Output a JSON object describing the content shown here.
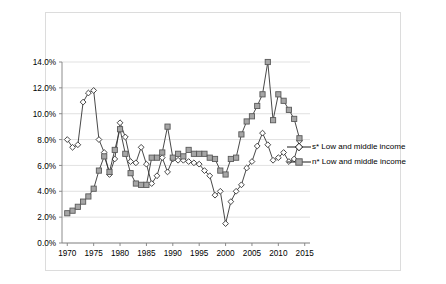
{
  "chart_data": {
    "type": "line",
    "title": "s* and n* low and middle income countries, 1970-2014",
    "xlabel": "",
    "ylabel": "",
    "xlim": [
      1969,
      2016
    ],
    "ylim": [
      0,
      14
    ],
    "ytick_labels": [
      "0.0%",
      "2.0%",
      "4.0%",
      "6.0%",
      "8.0%",
      "10.0%",
      "12.0%",
      "14.0%"
    ],
    "ytick_values": [
      0,
      2,
      4,
      6,
      8,
      10,
      12,
      14
    ],
    "xtick_labels": [
      "1970",
      "1975",
      "1980",
      "1985",
      "1990",
      "1995",
      "2000",
      "2005",
      "2010",
      "2015"
    ],
    "xtick_values": [
      1970,
      1975,
      1980,
      1985,
      1990,
      1995,
      2000,
      2005,
      2010,
      2015
    ],
    "grid": true,
    "legend_position": "right",
    "x": [
      1970,
      1971,
      1972,
      1973,
      1974,
      1975,
      1976,
      1977,
      1978,
      1979,
      1980,
      1981,
      1982,
      1983,
      1984,
      1985,
      1986,
      1987,
      1988,
      1989,
      1990,
      1991,
      1992,
      1993,
      1994,
      1995,
      1996,
      1997,
      1998,
      1999,
      2000,
      2001,
      2002,
      2003,
      2004,
      2005,
      2006,
      2007,
      2008,
      2009,
      2010,
      2011,
      2012,
      2013,
      2014
    ],
    "series": [
      {
        "name": "s* Low and middle income",
        "marker": "diamond-hollow",
        "color": "#000000",
        "values": [
          8.0,
          7.4,
          7.6,
          10.9,
          11.6,
          11.8,
          8.0,
          7.0,
          5.3,
          6.5,
          9.3,
          8.2,
          6.3,
          6.2,
          7.4,
          6.1,
          4.6,
          5.2,
          6.6,
          5.5,
          6.5,
          6.4,
          6.4,
          6.3,
          6.2,
          6.1,
          5.6,
          5.2,
          3.7,
          4.0,
          1.5,
          3.2,
          4.0,
          4.5,
          5.8,
          6.3,
          7.5,
          8.5,
          7.6,
          6.4,
          6.6,
          7.0,
          6.3,
          6.5,
          7.9
        ]
      },
      {
        "name": "n* Low and middle income",
        "marker": "square-filled",
        "color": "#808080",
        "values": [
          2.3,
          2.5,
          2.8,
          3.2,
          3.6,
          4.2,
          5.6,
          6.7,
          5.5,
          7.2,
          8.8,
          6.9,
          5.4,
          4.6,
          4.5,
          4.5,
          6.6,
          6.6,
          7.0,
          9.0,
          6.6,
          6.9,
          6.7,
          7.2,
          6.9,
          6.9,
          6.9,
          6.6,
          6.5,
          5.6,
          5.3,
          6.5,
          6.6,
          8.4,
          9.4,
          9.8,
          10.6,
          11.5,
          14.0,
          9.5,
          11.5,
          11.0,
          10.3,
          9.6,
          8.1
        ]
      }
    ]
  },
  "legend": {
    "items": [
      {
        "label": "s* Low and middle income",
        "marker": "diamond-hollow"
      },
      {
        "label": "n* Low and middle income",
        "marker": "square-filled"
      }
    ]
  }
}
